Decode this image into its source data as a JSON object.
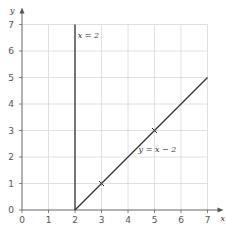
{
  "chart_data": {
    "type": "line",
    "title": "",
    "xlabel": "x",
    "ylabel": "y",
    "xlim": [
      0,
      7
    ],
    "ylim": [
      0,
      7
    ],
    "grid": true,
    "x_ticks": [
      "0",
      "1",
      "2",
      "3",
      "4",
      "5",
      "6",
      "7"
    ],
    "y_ticks": [
      "0",
      "1",
      "2",
      "3",
      "4",
      "5",
      "6",
      "7"
    ],
    "series": [
      {
        "name": "x = 2",
        "type": "vertical-line",
        "points": [
          [
            2,
            0
          ],
          [
            2,
            7
          ]
        ]
      },
      {
        "name": "y = x − 2",
        "type": "line",
        "points": [
          [
            2,
            0
          ],
          [
            7,
            5
          ]
        ]
      }
    ],
    "markers": [
      {
        "x": 3,
        "y": 1,
        "symbol": "x"
      },
      {
        "x": 5,
        "y": 3,
        "symbol": "x"
      }
    ],
    "annotations": [
      {
        "text": "x = 2",
        "x": 2.1,
        "y": 6.5
      },
      {
        "text": "y = x − 2",
        "x": 4.4,
        "y": 2.2
      }
    ]
  }
}
